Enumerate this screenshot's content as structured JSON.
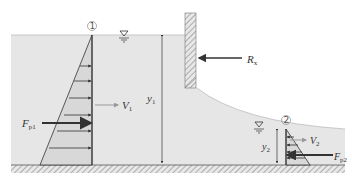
{
  "diagram": {
    "sections": [
      {
        "id": "section-1",
        "marker": "1",
        "marker_glyph": "①"
      },
      {
        "id": "section-2",
        "marker": "2",
        "marker_glyph": "②"
      }
    ],
    "labels": {
      "rx": {
        "main": "R",
        "sub": "x"
      },
      "v1": {
        "main": "V",
        "sub": "1"
      },
      "v2": {
        "main": "V",
        "sub": "2"
      },
      "y1": {
        "main": "y",
        "sub": "1"
      },
      "y2": {
        "main": "y",
        "sub": "2"
      },
      "fp1": {
        "main": "F",
        "sub": "p1"
      },
      "fp2": {
        "main": "F",
        "sub": "p2"
      }
    },
    "symbols": {
      "free_surface": "water-surface-triangle"
    },
    "colors": {
      "water": "#e6e6e6",
      "prism": "#d9d9d9",
      "line": "#333333",
      "velocity_arrow": "#999999",
      "hatch": "#aaaaaa"
    }
  }
}
